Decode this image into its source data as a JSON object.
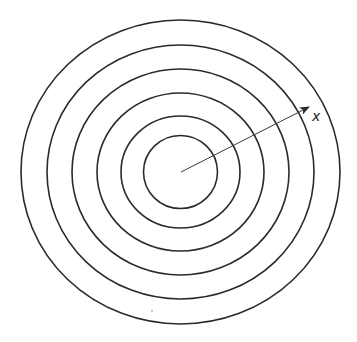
{
  "diagram": {
    "type": "concentric-rings",
    "center": {
      "x": 180.5,
      "y": 172
    },
    "stroke_color": "#2a2a2a",
    "arrow_color": "#3a3a3a",
    "rings": [
      {
        "rx": 159.5,
        "ry": 152
      },
      {
        "rx": 133.5,
        "ry": 127
      },
      {
        "rx": 108.5,
        "ry": 103
      },
      {
        "rx": 83.5,
        "ry": 79
      },
      {
        "rx": 59.5,
        "ry": 56
      },
      {
        "rx": 37,
        "ry": 36.5
      }
    ],
    "arrow": {
      "from": {
        "x": 181,
        "y": 172
      },
      "to": {
        "x": 309,
        "y": 107
      },
      "label": "x"
    }
  }
}
